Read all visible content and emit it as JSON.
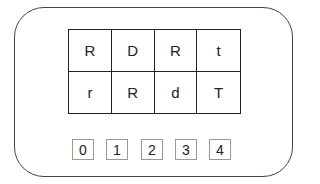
{
  "grid": {
    "rows": [
      [
        "R",
        "D",
        "R",
        "t"
      ],
      [
        "r",
        "R",
        "d",
        "T"
      ]
    ]
  },
  "options": [
    "0",
    "1",
    "2",
    "3",
    "4"
  ]
}
